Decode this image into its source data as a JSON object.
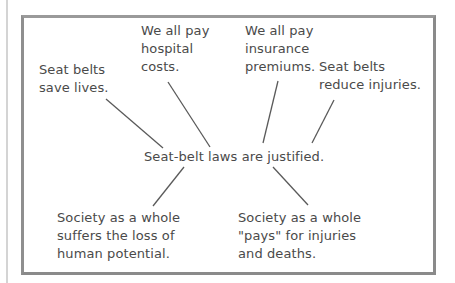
{
  "diagram": {
    "type": "argument-map",
    "claim": "Seat-belt laws are justified.",
    "reasons": [
      {
        "id": "save-lives",
        "text": "Seat belts\nsave lives."
      },
      {
        "id": "hospital-costs",
        "text": "We all pay\nhospital\ncosts."
      },
      {
        "id": "insurance-premiums",
        "text": "We all pay\ninsurance\npremiums."
      },
      {
        "id": "reduce-injuries",
        "text": "Seat belts\nreduce injuries."
      },
      {
        "id": "loss-of-potential",
        "text": "Society as a whole\nsuffers the loss of\nhuman potential."
      },
      {
        "id": "pays-for-injuries",
        "text": "Society as a whole\n\"pays\" for injuries\nand deaths."
      }
    ],
    "links": [
      {
        "from": "save-lives",
        "to": "claim",
        "x1": 106,
        "y1": 99,
        "x2": 163,
        "y2": 148
      },
      {
        "from": "hospital-costs",
        "to": "claim",
        "x1": 168,
        "y1": 82,
        "x2": 210,
        "y2": 147
      },
      {
        "from": "insurance-premiums",
        "to": "claim",
        "x1": 278,
        "y1": 81,
        "x2": 263,
        "y2": 143
      },
      {
        "from": "reduce-injuries",
        "to": "claim",
        "x1": 334,
        "y1": 100,
        "x2": 312,
        "y2": 143
      },
      {
        "from": "claim",
        "to": "loss-of-potential",
        "x1": 184,
        "y1": 167,
        "x2": 153,
        "y2": 206
      },
      {
        "from": "claim",
        "to": "pays-for-injuries",
        "x1": 273,
        "y1": 167,
        "x2": 308,
        "y2": 205
      }
    ],
    "colors": {
      "text": "#4a4a4a",
      "frame": "#8a8a8a",
      "line": "#5a5a5a"
    }
  }
}
